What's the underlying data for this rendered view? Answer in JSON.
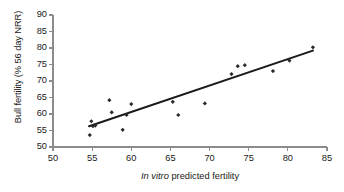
{
  "chart_data": {
    "type": "scatter",
    "title": "",
    "xlabel_italic": "In vitro",
    "xlabel_rest": " predicted fertility",
    "xlabel": "In vitro predicted fertility",
    "ylabel": "Bull fertility (% 56 day NRR)",
    "xlim": [
      50,
      85
    ],
    "ylim": [
      50,
      90
    ],
    "xticks": [
      50,
      55,
      60,
      65,
      70,
      75,
      80,
      85
    ],
    "yticks": [
      50,
      55,
      60,
      65,
      70,
      75,
      80,
      85,
      90
    ],
    "grid": false,
    "legend": null,
    "marker": "diamond",
    "marker_color": "#2b2b2b",
    "line_color": "#1a1a1a",
    "axis_color": "#8c8c8c",
    "points": [
      {
        "x": 54.7,
        "y": 53.6
      },
      {
        "x": 54.9,
        "y": 57.8
      },
      {
        "x": 55.1,
        "y": 56.3
      },
      {
        "x": 55.4,
        "y": 56.5
      },
      {
        "x": 57.2,
        "y": 64.2
      },
      {
        "x": 57.5,
        "y": 60.5
      },
      {
        "x": 58.9,
        "y": 55.2
      },
      {
        "x": 59.4,
        "y": 59.7
      },
      {
        "x": 60.0,
        "y": 63.0
      },
      {
        "x": 65.3,
        "y": 63.7
      },
      {
        "x": 66.0,
        "y": 59.7
      },
      {
        "x": 69.4,
        "y": 63.2
      },
      {
        "x": 72.8,
        "y": 72.1
      },
      {
        "x": 73.6,
        "y": 74.5
      },
      {
        "x": 74.5,
        "y": 74.8
      },
      {
        "x": 78.1,
        "y": 73.0
      },
      {
        "x": 80.2,
        "y": 76.2
      },
      {
        "x": 83.2,
        "y": 80.2
      }
    ],
    "trendline": {
      "x0": 54.6,
      "y0": 56.3,
      "x1": 83.2,
      "y1": 79.2
    }
  }
}
